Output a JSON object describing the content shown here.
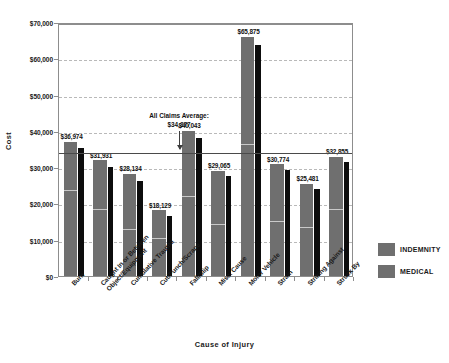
{
  "chart_data": {
    "type": "bar",
    "title": "",
    "xlabel": "Cause of Injury",
    "ylabel": "Cost",
    "ylim": [
      0,
      70000
    ],
    "yticks": [
      "$0",
      "$10,000",
      "$20,000",
      "$30,000",
      "$40,000",
      "$50,000",
      "$60,000",
      "$70,000"
    ],
    "ytick_values": [
      0,
      10000,
      20000,
      30000,
      40000,
      50000,
      60000,
      70000
    ],
    "grid": true,
    "legend_position": "right",
    "categories": [
      "Burn",
      "Caught In or Between Object/Equipment",
      "Cumulative Trauma",
      "Cut/Punch/Scrape",
      "Fall/Slip",
      "Misc. Cause",
      "Motor Vehicle",
      "Strain",
      "Striking Against",
      "Struck By"
    ],
    "category_lines": [
      [
        "Burn"
      ],
      [
        "Caught In or Between",
        "Object/Equipment"
      ],
      [
        "Cumulative Trauma"
      ],
      [
        "Cut/Punch/Scrape"
      ],
      [
        "Fall/Slip"
      ],
      [
        "Misc. Cause"
      ],
      [
        "Motor Vehicle"
      ],
      [
        "Strain"
      ],
      [
        "Striking Against"
      ],
      [
        "Struck By"
      ]
    ],
    "data_labels": [
      "$36,974",
      "$31,931",
      "$28,134",
      "$18,129",
      "$40,043",
      "$29,065",
      "$65,875",
      "$30,774",
      "$25,481",
      "$32,855"
    ],
    "totals": [
      36974,
      31931,
      28134,
      18129,
      40043,
      29065,
      65875,
      30774,
      25481,
      32855
    ],
    "series": [
      {
        "name": "INDEMNITY",
        "color": "#6f6f6f",
        "values": [
          36974,
          31931,
          28134,
          18129,
          40043,
          29065,
          65875,
          30774,
          25481,
          32855
        ],
        "indemnity_portion": [
          23400,
          18100,
          12800,
          10300,
          21800,
          14100,
          36200,
          15000,
          13200,
          18100
        ]
      },
      {
        "name": "MEDICAL",
        "color": "#0d0d0d",
        "values": [
          35200,
          30000,
          26300,
          16600,
          38100,
          27600,
          63600,
          29100,
          24000,
          31400
        ]
      }
    ],
    "annotation": {
      "line1": "All Claims Average:",
      "line2": "$34,377",
      "value": 34377
    }
  },
  "legend": {
    "items": [
      {
        "label": "INDEMNITY",
        "color": "#6f6f6f"
      },
      {
        "label": "MEDICAL",
        "color": "#6f6f6f"
      }
    ]
  }
}
